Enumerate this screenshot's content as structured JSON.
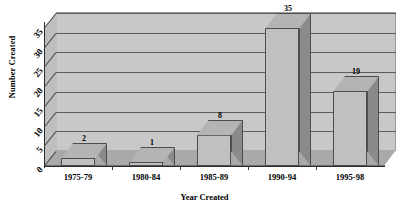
{
  "chart_data": {
    "type": "bar",
    "title": "",
    "xlabel": "Year Created",
    "ylabel": "Number Created",
    "categories": [
      "1975-79",
      "1980-84",
      "1985-89",
      "1990-94",
      "1995-98"
    ],
    "values": [
      2,
      1,
      8,
      35,
      19
    ],
    "value_labels": [
      "2",
      "1",
      "8",
      "35",
      "19"
    ],
    "ylim": [
      0,
      35
    ],
    "yticks": [
      0,
      5,
      10,
      15,
      20,
      25,
      30,
      35
    ],
    "ytick_labels": [
      "0",
      "5",
      "10",
      "15",
      "20",
      "25",
      "30",
      "35"
    ],
    "grid": true,
    "legend": false,
    "style": "3d-column",
    "colors": {
      "bar_front": "#c0c0c0",
      "bar_side": "#8a8a8a",
      "bar_top": "#b4b4b4",
      "bar_outline": "#4d4d4d",
      "plot_background": "#c8c8c8",
      "floor": "#a9a9a9",
      "gridline": "#5c5c5c",
      "axis": "#2b2b2b",
      "text": "#000000",
      "page_background": "#ffffff"
    }
  }
}
